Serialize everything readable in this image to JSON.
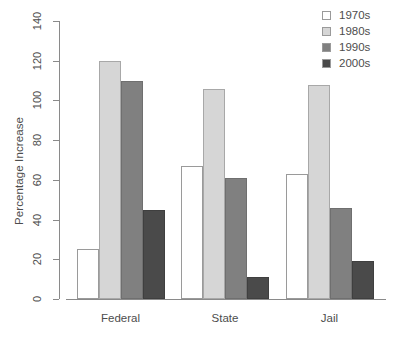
{
  "chart_data": {
    "type": "bar",
    "title": "",
    "subtitle": "",
    "xlabel": "",
    "ylabel": "Percentage Increase",
    "categories": [
      "Federal",
      "State",
      "Jail"
    ],
    "series": [
      {
        "name": "1970s",
        "color": "#ffffff",
        "values": [
          25,
          67,
          63
        ]
      },
      {
        "name": "1980s",
        "color": "#d6d6d6",
        "values": [
          120,
          106,
          108
        ]
      },
      {
        "name": "1990s",
        "color": "#808080",
        "values": [
          110,
          61,
          46
        ]
      },
      {
        "name": "2000s",
        "color": "#4a4a4a",
        "values": [
          45,
          11,
          19
        ]
      }
    ],
    "ylim": [
      0,
      140
    ],
    "yticks": [
      0,
      20,
      40,
      60,
      80,
      100,
      120,
      140
    ],
    "ytick_labels": [
      "0",
      "20",
      "40",
      "60",
      "80",
      "100",
      "120",
      "140"
    ],
    "grid": false,
    "legend_position": "top-right",
    "legend_entries": [
      "1970s",
      "1980s",
      "1990s",
      "2000s"
    ],
    "axis_color": "#8a8a8a",
    "text_color": "#4d4d4d",
    "background": "#ffffff"
  }
}
